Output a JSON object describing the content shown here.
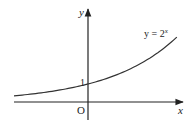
{
  "chart_data": {
    "type": "line",
    "title": "",
    "function": "y = 2^x",
    "curve_label": {
      "base": "y = 2",
      "exponent": "x"
    },
    "xlabel": "x",
    "ylabel": "y",
    "origin_label": "O",
    "y_intercept_label": "1",
    "series": [
      {
        "name": "y = 2^x",
        "x": [
          -1.5,
          -1.0,
          -0.5,
          0.0,
          0.5,
          1.0,
          1.5,
          1.85
        ],
        "y": [
          0.35,
          0.5,
          0.71,
          1.0,
          1.41,
          2.0,
          2.83,
          3.6
        ]
      }
    ],
    "xlim": [
      -1.55,
      2.0
    ],
    "ylim": [
      -1.0,
      5.2
    ],
    "grid": false,
    "legend": "none",
    "annotations": [
      {
        "text": "1",
        "at": [
          0,
          1
        ]
      },
      {
        "text": "O",
        "at": [
          0,
          0
        ]
      }
    ]
  },
  "colors": {
    "axis": "#222222",
    "curve": "#333333",
    "background": "#ffffff"
  }
}
